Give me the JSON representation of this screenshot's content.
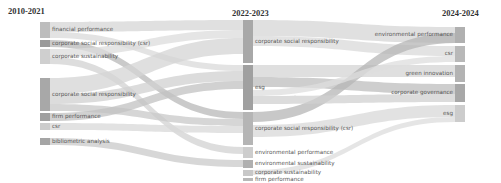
{
  "chart_data": {
    "type": "sankey",
    "title": "",
    "columns": [
      {
        "label": "2010-2021",
        "x": 40,
        "nodes": [
          {
            "id": "L0",
            "label": "financial performance",
            "y0": 22,
            "y1": 38,
            "shade": "#bdbdbd"
          },
          {
            "id": "L1",
            "label": "corporate social responsibility (csr)",
            "y0": 40,
            "y1": 47,
            "shade": "#9a9a9a"
          },
          {
            "id": "L2",
            "label": "corporate sustainability",
            "y0": 49,
            "y1": 64,
            "shade": "#cfcfcf"
          },
          {
            "id": "L3",
            "label": "corporate social responsibility",
            "y0": 78,
            "y1": 111,
            "shade": "#a8a8a8"
          },
          {
            "id": "L4",
            "label": "firm performance",
            "y0": 113,
            "y1": 121,
            "shade": "#a0a0a0"
          },
          {
            "id": "L5",
            "label": "csr",
            "y0": 123,
            "y1": 130,
            "shade": "#cccccc"
          },
          {
            "id": "L6",
            "label": "bibliometric analysis",
            "y0": 138,
            "y1": 145,
            "shade": "#a5a5a5"
          }
        ]
      },
      {
        "label": "2022-2023",
        "x": 243,
        "nodes": [
          {
            "id": "M0",
            "label": "corporate social responsibility",
            "y0": 20,
            "y1": 63,
            "shade": "#a8a8a8"
          },
          {
            "id": "M1",
            "label": "esg",
            "y0": 65,
            "y1": 110,
            "shade": "#a0a0a0"
          },
          {
            "id": "M2",
            "label": "corporate social responsibility (csr)",
            "y0": 112,
            "y1": 145,
            "shade": "#b5b5b5"
          },
          {
            "id": "M3",
            "label": "environmental performance",
            "y0": 147,
            "y1": 158,
            "shade": "#cdcdcd"
          },
          {
            "id": "M4",
            "label": "environmental sustainability",
            "y0": 160,
            "y1": 168,
            "shade": "#b0b0b0"
          },
          {
            "id": "M5",
            "label": "corporate sustainability",
            "y0": 170,
            "y1": 176,
            "shade": "#c8c8c8"
          },
          {
            "id": "M6",
            "label": "firm performance",
            "y0": 178,
            "y1": 181,
            "shade": "#b8b8b8"
          }
        ]
      },
      {
        "label": "2024-2024",
        "x": 455,
        "nodes": [
          {
            "id": "R0",
            "label": "environmental performance",
            "y0": 27,
            "y1": 43,
            "shade": "#b0b0b0"
          },
          {
            "id": "R1",
            "label": "csr",
            "y0": 46,
            "y1": 62,
            "shade": "#b8b8b8"
          },
          {
            "id": "R2",
            "label": "green innovation",
            "y0": 65,
            "y1": 82,
            "shade": "#b3b3b3"
          },
          {
            "id": "R3",
            "label": "corporate governance",
            "y0": 84,
            "y1": 102,
            "shade": "#a8a8a8"
          },
          {
            "id": "R4",
            "label": "esg",
            "y0": 105,
            "y1": 122,
            "shade": "#cccccc"
          }
        ]
      }
    ],
    "links": [
      {
        "source": "L0",
        "target": "M0",
        "sy": 22,
        "sh": 10,
        "ty": 20,
        "th": 10,
        "shade": "#d6d6d6"
      },
      {
        "source": "L0",
        "target": "M1",
        "sy": 32,
        "sh": 6,
        "ty": 65,
        "th": 6,
        "shade": "#d9d9d9"
      },
      {
        "source": "L1",
        "target": "M2",
        "sy": 40,
        "sh": 7,
        "ty": 112,
        "th": 7,
        "shade": "#b8b8b8"
      },
      {
        "source": "L2",
        "target": "M0",
        "sy": 49,
        "sh": 8,
        "ty": 30,
        "th": 8,
        "shade": "#dcdcdc"
      },
      {
        "source": "L2",
        "target": "M3",
        "sy": 57,
        "sh": 7,
        "ty": 147,
        "th": 7,
        "shade": "#d2d2d2"
      },
      {
        "source": "L3",
        "target": "M0",
        "sy": 78,
        "sh": 16,
        "ty": 38,
        "th": 16,
        "shade": "#d4d4d4"
      },
      {
        "source": "L3",
        "target": "M1",
        "sy": 94,
        "sh": 10,
        "ty": 71,
        "th": 10,
        "shade": "#d0d0d0"
      },
      {
        "source": "L3",
        "target": "M2",
        "sy": 104,
        "sh": 7,
        "ty": 119,
        "th": 7,
        "shade": "#c8c8c8"
      },
      {
        "source": "L4",
        "target": "M1",
        "sy": 113,
        "sh": 8,
        "ty": 81,
        "th": 8,
        "shade": "#c2c2c2"
      },
      {
        "source": "L5",
        "target": "M2",
        "sy": 123,
        "sh": 7,
        "ty": 126,
        "th": 7,
        "shade": "#d8d8d8"
      },
      {
        "source": "L6",
        "target": "M4",
        "sy": 138,
        "sh": 7,
        "ty": 160,
        "th": 7,
        "shade": "#c9c9c9"
      },
      {
        "source": "M0",
        "target": "R0",
        "sy": 20,
        "sh": 16,
        "ty": 27,
        "th": 16,
        "shade": "#d6d6d6"
      },
      {
        "source": "M0",
        "target": "R1",
        "sy": 36,
        "sh": 10,
        "ty": 46,
        "th": 10,
        "shade": "#dadada"
      },
      {
        "source": "M1",
        "target": "R2",
        "sy": 65,
        "sh": 12,
        "ty": 65,
        "th": 12,
        "shade": "#d4d4d4"
      },
      {
        "source": "M1",
        "target": "R3",
        "sy": 77,
        "sh": 10,
        "ty": 84,
        "th": 10,
        "shade": "#bdbdbd"
      },
      {
        "source": "M2",
        "target": "R0",
        "sy": 112,
        "sh": 10,
        "ty": 33,
        "th": 10,
        "shade": "#b5b5b5"
      },
      {
        "source": "M2",
        "target": "R4",
        "sy": 125,
        "sh": 12,
        "ty": 105,
        "th": 12,
        "shade": "#d8d8d8"
      },
      {
        "source": "M1",
        "target": "R1",
        "sy": 90,
        "sh": 6,
        "ty": 56,
        "th": 6,
        "shade": "#dedede"
      },
      {
        "source": "M1",
        "target": "R3",
        "sy": 96,
        "sh": 8,
        "ty": 94,
        "th": 8,
        "shade": "#d0d0d0"
      },
      {
        "source": "M5",
        "target": "R4",
        "sy": 170,
        "sh": 5,
        "ty": 117,
        "th": 5,
        "shade": "#dcdcdc"
      }
    ],
    "node_width": 10
  }
}
